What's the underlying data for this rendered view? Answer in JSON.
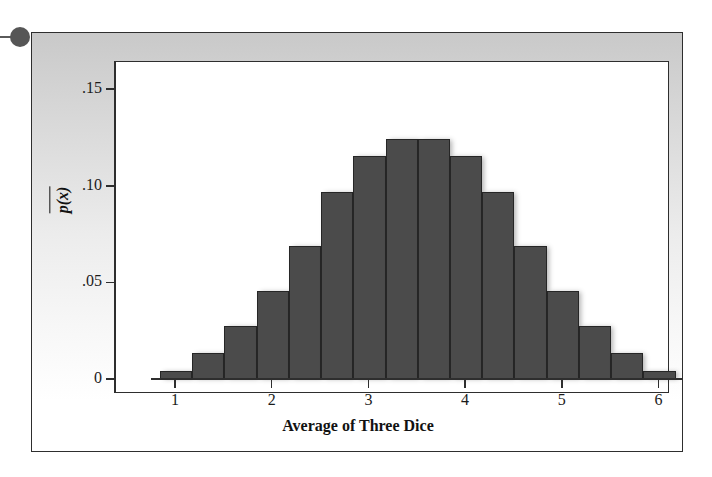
{
  "figure": {
    "bullet_marker": "bullet-dot",
    "background_top_color": "#c9c9c9",
    "background_bottom_color": "#ffffff",
    "frame_color": "#2e2e2e"
  },
  "chart_data": {
    "type": "bar",
    "title": "",
    "xlabel": "Average of Three Dice",
    "ylabel": "p(x̅)",
    "xvar": "x̅",
    "categories": [
      "1",
      "1.33",
      "1.67",
      "2",
      "2.33",
      "2.67",
      "3",
      "3.33",
      "3.67",
      "4",
      "4.33",
      "4.67",
      "5",
      "5.33",
      "5.67",
      "6"
    ],
    "values": [
      0.0046,
      0.0139,
      0.0278,
      0.0463,
      0.0694,
      0.0972,
      0.1157,
      0.125,
      0.125,
      0.1157,
      0.0972,
      0.0694,
      0.0463,
      0.0278,
      0.0139,
      0.0046
    ],
    "x": [
      1,
      1.3333,
      1.6667,
      2,
      2.3333,
      2.6667,
      3,
      3.3333,
      3.6667,
      4,
      4.3333,
      4.6667,
      5,
      5.3333,
      5.6667,
      6
    ],
    "bar_width": 0.3333,
    "xlim": [
      0.8333,
      6.1667
    ],
    "ylim": [
      0,
      0.1675
    ],
    "xticks": [
      1,
      2,
      3,
      4,
      5,
      6
    ],
    "xtick_labels": [
      "1",
      "2",
      "3",
      "4",
      "5",
      "6"
    ],
    "yticks": [
      0,
      0.05,
      0.1,
      0.15
    ],
    "ytick_labels": [
      "0",
      ".05",
      ".10",
      ".15"
    ],
    "grid": false,
    "legend": null,
    "bar_color": "#4b4b4b",
    "bar_edge_color": "#262626"
  }
}
